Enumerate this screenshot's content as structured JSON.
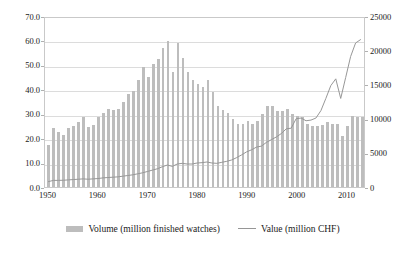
{
  "chart_data": {
    "type": "bar",
    "title": "",
    "subtitle": "",
    "xlabel": "",
    "ylabel": "",
    "y2label": "",
    "grid": true,
    "legend_position": "bottom",
    "xlim": [
      1949.3,
      2013.7
    ],
    "ylim": [
      0,
      70
    ],
    "y2lim": [
      0,
      25000
    ],
    "y_ticks": [
      "0.0",
      "10.0",
      "20.0",
      "30.0",
      "40.0",
      "50.0",
      "60.0",
      "70.0"
    ],
    "y_tick_values": [
      0,
      10,
      20,
      30,
      40,
      50,
      60,
      70
    ],
    "y2_ticks": [
      "0",
      "5000",
      "10000",
      "15000",
      "20000",
      "25000"
    ],
    "y2_tick_values": [
      0,
      5000,
      10000,
      15000,
      20000,
      25000
    ],
    "x_ticks": [
      "1950",
      "1960",
      "1970",
      "1980",
      "1990",
      "2000",
      "2010"
    ],
    "x_tick_values": [
      1950,
      1960,
      1970,
      1980,
      1990,
      2000,
      2010
    ],
    "x": [
      1950,
      1951,
      1952,
      1953,
      1954,
      1955,
      1956,
      1957,
      1958,
      1959,
      1960,
      1961,
      1962,
      1963,
      1964,
      1965,
      1966,
      1967,
      1968,
      1969,
      1970,
      1971,
      1972,
      1973,
      1974,
      1975,
      1976,
      1977,
      1978,
      1979,
      1980,
      1981,
      1982,
      1983,
      1984,
      1985,
      1986,
      1987,
      1988,
      1989,
      1990,
      1991,
      1992,
      1993,
      1994,
      1995,
      1996,
      1997,
      1998,
      1999,
      2000,
      2001,
      2002,
      2003,
      2004,
      2005,
      2006,
      2007,
      2008,
      2009,
      2010,
      2011,
      2012,
      2013
    ],
    "series": [
      {
        "name": "Volume (million finished watches)",
        "axis": "left",
        "unit": "million finished watches",
        "render": "bar",
        "color": "#bdbdbd",
        "values": [
          17.0,
          24.0,
          22.6,
          21.3,
          24.2,
          24.8,
          26.5,
          28.5,
          24.4,
          25.3,
          28.8,
          30.3,
          31.8,
          31.7,
          32.1,
          35.0,
          38.0,
          39.5,
          44.0,
          49.0,
          45.0,
          50.3,
          52.5,
          57.0,
          59.8,
          47.0,
          58.8,
          53.0,
          47.0,
          44.0,
          42.3,
          41.0,
          43.8,
          39.0,
          33.0,
          31.5,
          30.5,
          28.0,
          26.0,
          26.0,
          27.0,
          26.0,
          27.0,
          30.0,
          33.0,
          33.0,
          31.0,
          31.0,
          32.0,
          30.0,
          29.0,
          28.5,
          26.0,
          25.0,
          25.0,
          25.5,
          26.5,
          26.0,
          26.0,
          21.0,
          25.0,
          29.0,
          28.5,
          28.5
        ]
      },
      {
        "name": "Value (million CHF)",
        "axis": "right",
        "unit": "million CHF",
        "render": "line",
        "color": "#969696",
        "values": [
          800,
          980,
          980,
          1000,
          1050,
          1100,
          1150,
          1200,
          1150,
          1200,
          1250,
          1350,
          1400,
          1450,
          1500,
          1600,
          1700,
          1800,
          1950,
          2100,
          2300,
          2500,
          2700,
          3000,
          3250,
          3050,
          3400,
          3500,
          3400,
          3400,
          3550,
          3600,
          3700,
          3550,
          3500,
          3650,
          3800,
          4000,
          4350,
          4750,
          5200,
          5500,
          5900,
          6050,
          6600,
          7000,
          7400,
          7900,
          8600,
          8700,
          10100,
          10200,
          9800,
          9900,
          10200,
          11300,
          13100,
          15000,
          16000,
          13100,
          16200,
          19300,
          21300,
          21800
        ]
      }
    ]
  },
  "legend": {
    "items": [
      {
        "label": "Volume (million finished watches)",
        "marker": "bar-swatch"
      },
      {
        "label": "Value (million CHF)",
        "marker": "line-swatch"
      }
    ]
  }
}
